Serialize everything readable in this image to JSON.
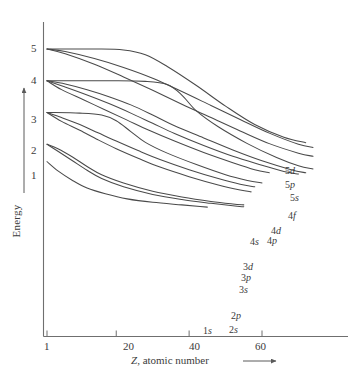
{
  "chart_data": {
    "type": "line",
    "title": "",
    "xlabel": "Z, atomic number",
    "ylabel": "Energy",
    "xticks": [
      1,
      20,
      40,
      60
    ],
    "xticklabels": [
      "1",
      "20",
      "40",
      "60"
    ],
    "yticks": [
      1,
      2,
      3,
      4,
      5
    ],
    "yticklabels": [
      "1",
      "2",
      "3",
      "4",
      "5"
    ],
    "xlim": [
      1,
      92
    ],
    "ylim": [
      0,
      5.6
    ],
    "grid": false,
    "legend_position": "right-inline-labels",
    "axis_arrow_x": true,
    "axis_arrow_y": true,
    "series": [
      {
        "name": "5d",
        "label": "5d",
        "points": [
          [
            1,
            5.0
          ],
          [
            14,
            5.0
          ],
          [
            22,
            4.97
          ],
          [
            28,
            4.82
          ],
          [
            34,
            4.45
          ],
          [
            42,
            3.85
          ],
          [
            50,
            3.2
          ],
          [
            58,
            2.62
          ],
          [
            66,
            2.22
          ],
          [
            72,
            2.05
          ]
        ]
      },
      {
        "name": "5p",
        "label": "5p",
        "points": [
          [
            1,
            5.0
          ],
          [
            6,
            4.92
          ],
          [
            14,
            4.7
          ],
          [
            22,
            4.42
          ],
          [
            30,
            4.08
          ],
          [
            38,
            3.66
          ],
          [
            46,
            3.22
          ],
          [
            54,
            2.78
          ],
          [
            62,
            2.35
          ],
          [
            70,
            2.0
          ],
          [
            74,
            1.9
          ]
        ]
      },
      {
        "name": "5s",
        "label": "5s",
        "points": [
          [
            1,
            5.0
          ],
          [
            6,
            4.85
          ],
          [
            14,
            4.52
          ],
          [
            22,
            4.12
          ],
          [
            30,
            3.7
          ],
          [
            38,
            3.26
          ],
          [
            46,
            2.84
          ],
          [
            54,
            2.42
          ],
          [
            62,
            2.02
          ],
          [
            70,
            1.72
          ],
          [
            74,
            1.62
          ]
        ]
      },
      {
        "name": "4f",
        "label": "4f",
        "points": [
          [
            1,
            4.0
          ],
          [
            18,
            4.0
          ],
          [
            28,
            3.98
          ],
          [
            34,
            3.88
          ],
          [
            38,
            3.55
          ],
          [
            42,
            3.05
          ],
          [
            48,
            2.55
          ],
          [
            56,
            2.02
          ],
          [
            64,
            1.58
          ],
          [
            70,
            1.32
          ],
          [
            74,
            1.22
          ]
        ]
      },
      {
        "name": "4d",
        "label": "4d",
        "points": [
          [
            1,
            4.0
          ],
          [
            6,
            3.9
          ],
          [
            12,
            3.72
          ],
          [
            18,
            3.5
          ],
          [
            24,
            3.24
          ],
          [
            30,
            2.92
          ],
          [
            36,
            2.58
          ],
          [
            44,
            2.2
          ],
          [
            52,
            1.82
          ],
          [
            60,
            1.48
          ],
          [
            68,
            1.2
          ],
          [
            72,
            1.1
          ]
        ]
      },
      {
        "name": "4p",
        "label": "4p",
        "points": [
          [
            1,
            4.0
          ],
          [
            6,
            3.8
          ],
          [
            12,
            3.55
          ],
          [
            18,
            3.28
          ],
          [
            24,
            2.98
          ],
          [
            30,
            2.66
          ],
          [
            36,
            2.34
          ],
          [
            44,
            1.96
          ],
          [
            52,
            1.62
          ],
          [
            60,
            1.34
          ],
          [
            66,
            1.14
          ],
          [
            70,
            1.06
          ]
        ]
      },
      {
        "name": "4s",
        "label": "4s",
        "points": [
          [
            1,
            4.0
          ],
          [
            5,
            3.72
          ],
          [
            11,
            3.4
          ],
          [
            17,
            3.08
          ],
          [
            23,
            2.76
          ],
          [
            29,
            2.44
          ],
          [
            36,
            2.1
          ],
          [
            44,
            1.74
          ],
          [
            52,
            1.42
          ],
          [
            58,
            1.2
          ],
          [
            62,
            1.1
          ]
        ]
      },
      {
        "name": "3d",
        "label": "3d",
        "points": [
          [
            1,
            3.0
          ],
          [
            10,
            2.98
          ],
          [
            16,
            2.92
          ],
          [
            20,
            2.74
          ],
          [
            24,
            2.4
          ],
          [
            28,
            2.06
          ],
          [
            34,
            1.72
          ],
          [
            42,
            1.36
          ],
          [
            50,
            1.04
          ],
          [
            56,
            0.86
          ],
          [
            60,
            0.78
          ]
        ]
      },
      {
        "name": "3p",
        "label": "3p",
        "points": [
          [
            1,
            3.0
          ],
          [
            5,
            2.84
          ],
          [
            10,
            2.62
          ],
          [
            15,
            2.36
          ],
          [
            20,
            2.1
          ],
          [
            26,
            1.8
          ],
          [
            32,
            1.52
          ],
          [
            40,
            1.2
          ],
          [
            48,
            0.92
          ],
          [
            54,
            0.74
          ],
          [
            58,
            0.66
          ]
        ]
      },
      {
        "name": "3s",
        "label": "3s",
        "points": [
          [
            1,
            3.0
          ],
          [
            5,
            2.72
          ],
          [
            10,
            2.44
          ],
          [
            15,
            2.14
          ],
          [
            20,
            1.86
          ],
          [
            26,
            1.56
          ],
          [
            32,
            1.28
          ],
          [
            40,
            0.98
          ],
          [
            48,
            0.72
          ],
          [
            54,
            0.56
          ],
          [
            57,
            0.5
          ]
        ]
      },
      {
        "name": "2p",
        "label": "2p",
        "points": [
          [
            1,
            2.0
          ],
          [
            4,
            1.86
          ],
          [
            8,
            1.6
          ],
          [
            12,
            1.3
          ],
          [
            16,
            1.04
          ],
          [
            22,
            0.78
          ],
          [
            30,
            0.52
          ],
          [
            38,
            0.34
          ],
          [
            46,
            0.2
          ],
          [
            52,
            0.12
          ],
          [
            55,
            0.09
          ]
        ]
      },
      {
        "name": "2s",
        "label": "2s",
        "points": [
          [
            1,
            2.0
          ],
          [
            4,
            1.78
          ],
          [
            8,
            1.48
          ],
          [
            12,
            1.18
          ],
          [
            16,
            0.92
          ],
          [
            22,
            0.66
          ],
          [
            30,
            0.42
          ],
          [
            38,
            0.26
          ],
          [
            46,
            0.14
          ],
          [
            52,
            0.06
          ],
          [
            55,
            0.03
          ]
        ]
      },
      {
        "name": "1s",
        "label": "1s",
        "points": [
          [
            1,
            1.45
          ],
          [
            4,
            1.16
          ],
          [
            8,
            0.86
          ],
          [
            12,
            0.62
          ],
          [
            17,
            0.44
          ],
          [
            23,
            0.28
          ],
          [
            30,
            0.17
          ],
          [
            38,
            0.09
          ],
          [
            43,
            0.04
          ],
          [
            45,
            0.02
          ]
        ]
      }
    ],
    "line_color": "#4a4a4a",
    "axis_color": "#6b6b6b",
    "background": "#ffffff"
  },
  "labels": {
    "y_axis_title": "Energy",
    "x_axis_title_italic": "Z",
    "x_axis_title_rest": ", atomic number",
    "ytick_5": "5",
    "ytick_4": "4",
    "ytick_3": "3",
    "ytick_2": "2",
    "ytick_1": "1",
    "xtick_1": "1",
    "xtick_20": "20",
    "xtick_40": "40",
    "xtick_60": "60",
    "orb_5d_n": "5",
    "orb_5d_l": "d",
    "orb_5p_n": "5",
    "orb_5p_l": "p",
    "orb_5s_n": "5",
    "orb_5s_l": "s",
    "orb_4f_n": "4",
    "orb_4f_l": "f",
    "orb_4d_n": "4",
    "orb_4d_l": "d",
    "orb_4p_n": "4",
    "orb_4p_l": "p",
    "orb_4s_n": "4",
    "orb_4s_l": "s",
    "orb_3d_n": "3",
    "orb_3d_l": "d",
    "orb_3p_n": "3",
    "orb_3p_l": "p",
    "orb_3s_n": "3",
    "orb_3s_l": "s",
    "orb_2p_n": "2",
    "orb_2p_l": "p",
    "orb_2s_n": "2",
    "orb_2s_l": "s",
    "orb_1s_n": "1",
    "orb_1s_l": "s"
  }
}
